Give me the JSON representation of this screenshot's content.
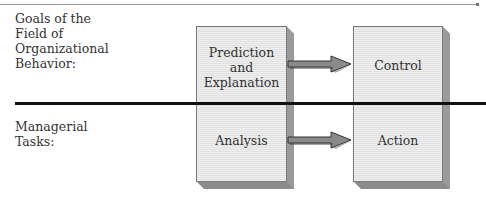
{
  "diagram": {
    "rows": [
      {
        "label": "Goals of the\nField of\nOrganizational\nBehavior:",
        "label_lines": [
          "Goals of the",
          "Field of",
          "Organizational",
          "Behavior:"
        ],
        "left_box": {
          "lines": [
            "Prediction",
            "and",
            "Explanation"
          ]
        },
        "right_box": {
          "lines": [
            "Control"
          ]
        }
      },
      {
        "label_lines": [
          "Managerial",
          "Tasks:"
        ],
        "left_box": {
          "lines": [
            "Analysis"
          ]
        },
        "right_box": {
          "lines": [
            "Action"
          ]
        }
      }
    ],
    "connections": [
      {
        "from": "Prediction and Explanation",
        "to": "Control"
      },
      {
        "from": "Analysis",
        "to": "Action"
      }
    ],
    "colors": {
      "box_face": "#e6e6e6",
      "box_shadow": "#8c8c8c",
      "arrow_fill": "#8a8a8a",
      "divider": "#111111"
    }
  }
}
